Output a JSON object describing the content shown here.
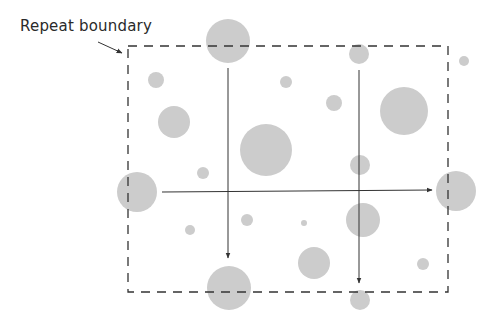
{
  "diagram": {
    "label": "Repeat boundary",
    "colors": {
      "circle_fill": "#cccccc",
      "line": "#333333",
      "dash": "#333333",
      "background": "#ffffff"
    },
    "boundary": {
      "x": 128,
      "y": 46,
      "width": 320,
      "height": 246
    },
    "circles": [
      {
        "cx": 228,
        "cy": 41,
        "r": 22
      },
      {
        "cx": 156,
        "cy": 80,
        "r": 8
      },
      {
        "cx": 174,
        "cy": 122,
        "r": 16
      },
      {
        "cx": 286,
        "cy": 82,
        "r": 6
      },
      {
        "cx": 334,
        "cy": 103,
        "r": 8
      },
      {
        "cx": 359,
        "cy": 54,
        "r": 10
      },
      {
        "cx": 404,
        "cy": 111,
        "r": 24
      },
      {
        "cx": 464,
        "cy": 61,
        "r": 5
      },
      {
        "cx": 266,
        "cy": 150,
        "r": 26
      },
      {
        "cx": 360,
        "cy": 165,
        "r": 10
      },
      {
        "cx": 137,
        "cy": 192,
        "r": 20
      },
      {
        "cx": 203,
        "cy": 173,
        "r": 6
      },
      {
        "cx": 456,
        "cy": 191,
        "r": 20
      },
      {
        "cx": 190,
        "cy": 230,
        "r": 5
      },
      {
        "cx": 247,
        "cy": 220,
        "r": 6
      },
      {
        "cx": 304,
        "cy": 223,
        "r": 3
      },
      {
        "cx": 363,
        "cy": 220,
        "r": 17
      },
      {
        "cx": 314,
        "cy": 263,
        "r": 16
      },
      {
        "cx": 423,
        "cy": 264,
        "r": 6
      },
      {
        "cx": 229,
        "cy": 288,
        "r": 22
      },
      {
        "cx": 360,
        "cy": 300,
        "r": 10
      }
    ],
    "arrows": [
      {
        "name": "arrow-down-left",
        "x1": 228,
        "y1": 68,
        "x2": 228,
        "y2": 258
      },
      {
        "name": "arrow-down-right",
        "x1": 359,
        "y1": 70,
        "x2": 359,
        "y2": 283
      },
      {
        "name": "arrow-right",
        "x1": 162,
        "y1": 192,
        "x2": 432,
        "y2": 190
      }
    ],
    "pointer": {
      "x1": 98,
      "y1": 42,
      "x2": 122,
      "y2": 53
    }
  }
}
